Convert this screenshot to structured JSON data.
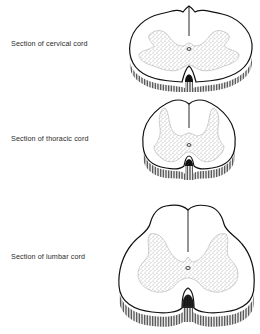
{
  "figure": {
    "sections": [
      {
        "id": "cervical",
        "label": "Section of cervical cord"
      },
      {
        "id": "thoracic",
        "label": "Section of thoracic cord"
      },
      {
        "id": "lumbar",
        "label": "Section of lumbar cord"
      }
    ]
  },
  "colors": {
    "ink": "#1a1a1a",
    "grey_matter_stipple": "#555555",
    "background": "#ffffff"
  }
}
